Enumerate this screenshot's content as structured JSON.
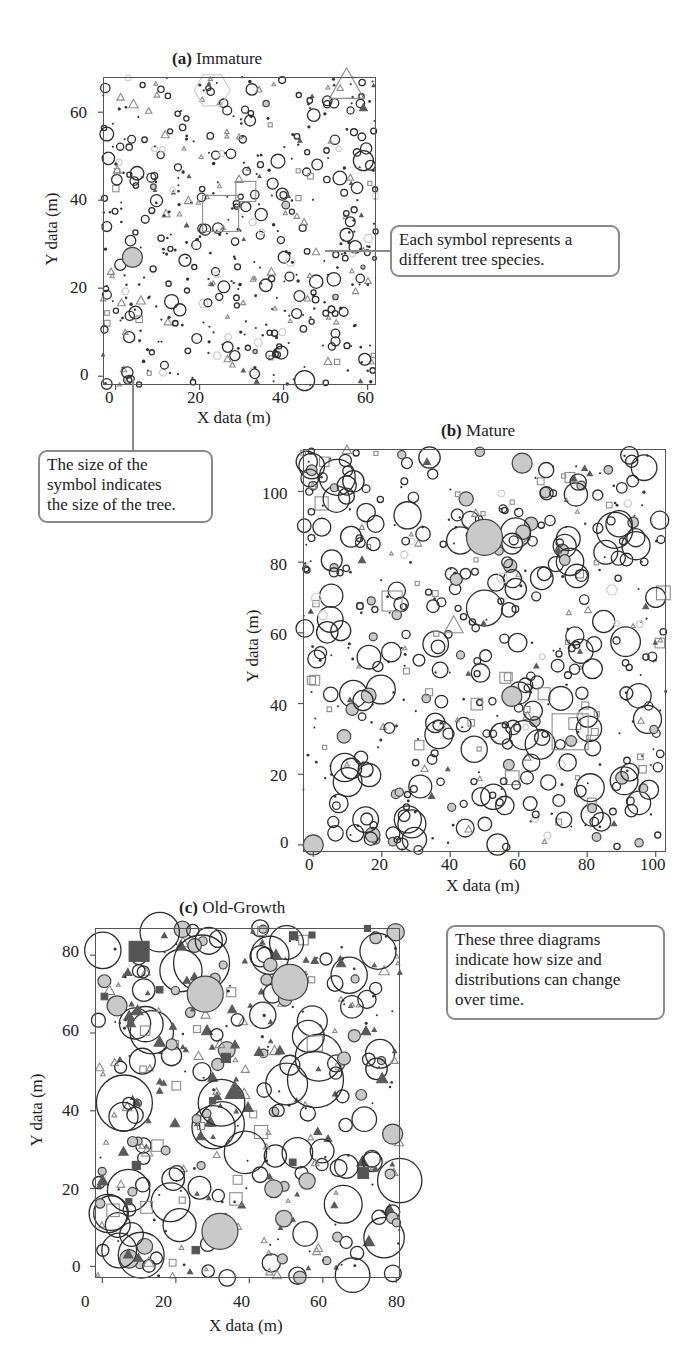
{
  "chart_data": [
    {
      "id": "a",
      "type": "scatter",
      "title_letter": "(a)",
      "title": "Immature",
      "xlabel": "X data (m)",
      "ylabel": "Y data (m)",
      "xlim": [
        -3,
        62
      ],
      "ylim": [
        -2,
        68
      ],
      "xticks": [
        0,
        20,
        40,
        60
      ],
      "yticks": [
        0,
        20,
        40,
        60
      ],
      "grid": false,
      "legend": "none",
      "description": "Dense stand of many small trees; mostly small black open circles and dots, scattered gray open triangles, a few large open squares and a light hexagon.",
      "notable_points": [
        {
          "shape": "square-open",
          "x": 25,
          "y": 37,
          "size": "large"
        },
        {
          "shape": "square-open",
          "x": 31,
          "y": 42,
          "size": "medium"
        },
        {
          "shape": "hexagon-open",
          "x": 23,
          "y": 65,
          "size": "large"
        },
        {
          "shape": "triangle-open",
          "x": 55,
          "y": 66,
          "size": "large"
        },
        {
          "shape": "triangle-filled",
          "x": 59,
          "y": 61,
          "size": "small"
        },
        {
          "shape": "circle-filled",
          "x": 4,
          "y": 27,
          "size": "medium"
        },
        {
          "shape": "circle-open",
          "x": 45,
          "y": -1,
          "size": "medium"
        },
        {
          "shape": "circle-open",
          "x": 59,
          "y": 49,
          "size": "medium"
        }
      ]
    },
    {
      "id": "b",
      "type": "scatter",
      "title_letter": "(b)",
      "title": "Mature",
      "xlabel": "X data (m)",
      "ylabel": "Y data (m)",
      "xlim": [
        -3,
        103
      ],
      "ylim": [
        -2,
        112
      ],
      "xticks": [
        0,
        20,
        40,
        60,
        80,
        100
      ],
      "yticks": [
        0,
        20,
        40,
        60,
        80,
        100
      ],
      "grid": false,
      "legend": "none",
      "description": "Medium-sized trees; many medium black open circles, several gray-filled circles, open squares and triangles; a relatively open area around y=70-80.",
      "notable_points": [
        {
          "shape": "circle-filled",
          "x": 0,
          "y": 0,
          "size": "medium"
        },
        {
          "shape": "circle-filled",
          "x": 50,
          "y": 87,
          "size": "large"
        },
        {
          "shape": "circle-filled",
          "x": 61,
          "y": 108,
          "size": "medium"
        },
        {
          "shape": "circle-filled",
          "x": 58,
          "y": 42,
          "size": "medium"
        },
        {
          "shape": "circle-open",
          "x": 7,
          "y": 104,
          "size": "large"
        },
        {
          "shape": "circle-open",
          "x": 50,
          "y": 67,
          "size": "large"
        },
        {
          "shape": "circle-open",
          "x": 88,
          "y": 89,
          "size": "large"
        },
        {
          "shape": "circle-open",
          "x": 100,
          "y": 70,
          "size": "medium"
        },
        {
          "shape": "square-open",
          "x": 23,
          "y": 69,
          "size": "medium"
        },
        {
          "shape": "square-open",
          "x": 75,
          "y": 32,
          "size": "large"
        },
        {
          "shape": "triangle-open",
          "x": 41,
          "y": 62,
          "size": "medium"
        }
      ]
    },
    {
      "id": "c",
      "type": "scatter",
      "title_letter": "(c)",
      "title": "Old-Growth",
      "xlabel": "X data (m)",
      "ylabel": "Y data (m)",
      "xlim": [
        -2,
        81
      ],
      "ylim": [
        -3,
        87
      ],
      "xticks": [
        0,
        20,
        40,
        60,
        80
      ],
      "yticks": [
        0,
        20,
        40,
        60,
        80
      ],
      "grid": false,
      "legend": "none",
      "description": "Fewer, much larger trees; large black open circles and gray-filled circles, dense dark-filled triangles in the lower-right and upper-middle, a few dark-filled squares.",
      "notable_points": [
        {
          "shape": "circle-open",
          "x": 6,
          "y": 42,
          "size": "xlarge"
        },
        {
          "shape": "circle-open",
          "x": 27,
          "y": 78,
          "size": "xlarge"
        },
        {
          "shape": "circle-open",
          "x": 58,
          "y": 48,
          "size": "xlarge"
        },
        {
          "shape": "circle-open",
          "x": 75,
          "y": 81,
          "size": "large"
        },
        {
          "shape": "circle-filled",
          "x": 28,
          "y": 70,
          "size": "large"
        },
        {
          "shape": "circle-filled",
          "x": 51,
          "y": 73,
          "size": "large"
        },
        {
          "shape": "circle-filled",
          "x": 32,
          "y": 9,
          "size": "large"
        },
        {
          "shape": "circle-filled",
          "x": 79,
          "y": 34,
          "size": "medium"
        },
        {
          "shape": "circle-filled",
          "x": 4,
          "y": 67,
          "size": "medium"
        },
        {
          "shape": "square-filled",
          "x": 10,
          "y": 81,
          "size": "medium"
        },
        {
          "shape": "square-filled",
          "x": 52,
          "y": 85,
          "size": "small"
        },
        {
          "shape": "triangle-filled",
          "x": 36,
          "y": 45,
          "size": "medium"
        }
      ]
    }
  ],
  "panels": {
    "a": {
      "letter": "(a)",
      "name": "Immature",
      "xlabel": "X data (m)",
      "ylabel": "Y data (m)",
      "xticks": [
        "0",
        "20",
        "40",
        "60"
      ],
      "yticks": [
        "0",
        "20",
        "40",
        "60"
      ]
    },
    "b": {
      "letter": "(b)",
      "name": "Mature",
      "xlabel": "X data (m)",
      "ylabel": "Y data (m)",
      "xticks": [
        "0",
        "20",
        "40",
        "60",
        "80",
        "100"
      ],
      "yticks": [
        "0",
        "20",
        "40",
        "60",
        "80",
        "100"
      ]
    },
    "c": {
      "letter": "(c)",
      "name": "Old-Growth",
      "xlabel": "X data (m)",
      "ylabel": "Y data (m)",
      "xticks": [
        "0",
        "20",
        "40",
        "60",
        "80"
      ],
      "yticks": [
        "0",
        "20",
        "40",
        "60",
        "80"
      ]
    }
  },
  "callouts": {
    "species": {
      "lines": [
        "Each symbol represents a",
        "different tree species."
      ]
    },
    "size": {
      "lines": [
        "The size of the",
        "symbol indicates",
        "the size of the tree."
      ]
    },
    "time": {
      "lines": [
        "These three diagrams",
        "indicate how size and",
        "distributions can change",
        "over time."
      ]
    }
  },
  "colors": {
    "circle_outline": "#2e2e2e",
    "circle_fill": "#c9c9c9",
    "triangle_outline": "#8c8c8c",
    "triangle_fill": "#5a5a5a",
    "square_outline": "#8c8c8c",
    "square_fill": "#555555",
    "hexagon": "#cfcfcf",
    "dot": "#333333",
    "frame": "#555555",
    "callout_border": "#8a8a8a"
  }
}
